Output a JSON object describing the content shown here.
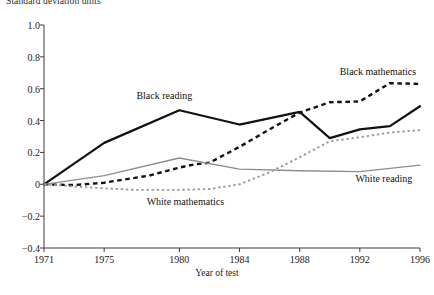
{
  "chart_data": {
    "type": "line",
    "title": "Standard deviation units",
    "xlabel": "Year of test",
    "ylabel": "Standard deviation units",
    "grid": false,
    "legend_position": "inline-annotations",
    "xlim": [
      1971,
      1996
    ],
    "ylim": [
      -0.4,
      1.0
    ],
    "ytick_labels": [
      "1.0",
      "0.8",
      "0.6",
      "0.4",
      "0.2",
      "0",
      "−0.2",
      "−0.4"
    ],
    "ytick_values": [
      1.0,
      0.8,
      0.6,
      0.4,
      0.2,
      0,
      -0.2,
      -0.4
    ],
    "xtick_labels": [
      "1971",
      "1975",
      "1980",
      "1984",
      "1988",
      "1992",
      "1996"
    ],
    "xtick_values": [
      1971,
      1975,
      1980,
      1984,
      1988,
      1992,
      1996
    ],
    "series": [
      {
        "name": "Black reading",
        "color": "#111111",
        "style": "solid",
        "width": 2.2,
        "label_x": 1979.0,
        "label_y": 0.545,
        "x": [
          1971,
          1975,
          1980,
          1984,
          1988,
          1990,
          1992,
          1994,
          1996
        ],
        "values": [
          0.0,
          0.26,
          0.465,
          0.375,
          0.455,
          0.29,
          0.345,
          0.365,
          0.49
        ]
      },
      {
        "name": "Black mathematics",
        "color": "#111111",
        "style": "dashed",
        "width": 2.4,
        "label_x": 1993.2,
        "label_y": 0.7,
        "x": [
          1971,
          1973,
          1975,
          1978,
          1980,
          1981,
          1982,
          1984,
          1986,
          1988,
          1990,
          1992,
          1994,
          1996
        ],
        "values": [
          0.0,
          -0.005,
          0.01,
          0.055,
          0.105,
          0.125,
          0.135,
          0.235,
          0.345,
          0.45,
          0.515,
          0.52,
          0.635,
          0.63
        ]
      },
      {
        "name": "White reading",
        "color": "#8d8d8d",
        "style": "solid",
        "width": 1.3,
        "label_x": 1993.6,
        "label_y": 0.03,
        "x": [
          1971,
          1975,
          1980,
          1984,
          1988,
          1992,
          1996
        ],
        "values": [
          0.0,
          0.055,
          0.165,
          0.095,
          0.085,
          0.08,
          0.12
        ]
      },
      {
        "name": "White mathematics",
        "color": "#9a9a9a",
        "style": "dotted",
        "width": 1.9,
        "label_x": 1980.4,
        "label_y": -0.115,
        "x": [
          1971,
          1974,
          1977,
          1980,
          1982,
          1984,
          1986,
          1988,
          1990,
          1992,
          1994,
          1996
        ],
        "values": [
          0.0,
          -0.02,
          -0.035,
          -0.035,
          -0.03,
          0.0,
          0.075,
          0.17,
          0.27,
          0.295,
          0.325,
          0.34
        ]
      }
    ]
  }
}
